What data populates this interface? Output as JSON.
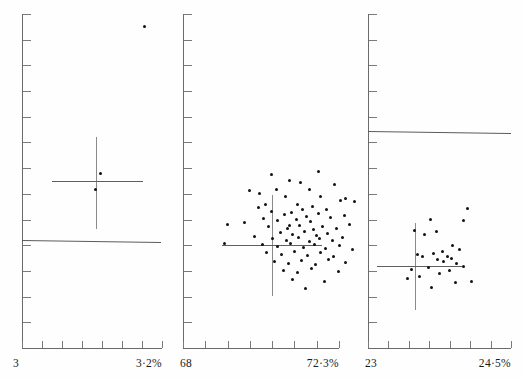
{
  "figure": {
    "type": "multi-panel-scatter",
    "panel_count": 3,
    "width": 523,
    "height": 378,
    "background": "#ffffff",
    "point_color": "#111111",
    "axis_color": "#6a6a6a"
  },
  "chart_data": [
    {
      "type": "scatter",
      "panel_index": 0,
      "title": "",
      "xlabel": "",
      "ylabel": "",
      "x_tick_count": 7,
      "y_tick_count": 13,
      "grid": false,
      "legend": null,
      "axis_min_label": "3",
      "axis_max_label": "3·2%",
      "xlim": [
        3.0,
        3.2
      ],
      "n_points": 3,
      "points": [
        {
          "x": 144,
          "y": 26
        },
        {
          "x": 100,
          "y": 173
        },
        {
          "x": 95,
          "y": 189
        }
      ],
      "cross": {
        "cx": 96,
        "cy": 181,
        "x_left": 52,
        "x_right": 143,
        "y_top": 137,
        "y_bottom": 229
      },
      "trend_line": {
        "x1": 22,
        "y1": 240,
        "x2": 161,
        "y2": 242
      }
    },
    {
      "type": "scatter",
      "panel_index": 1,
      "title": "",
      "xlabel": "",
      "ylabel": "",
      "x_tick_count": 7,
      "y_tick_count": 13,
      "grid": false,
      "legend": null,
      "axis_min_label": "68",
      "axis_max_label": "72·3%",
      "xlim": [
        68.0,
        72.3
      ],
      "n_points": 78,
      "points": [
        {
          "x": 318,
          "y": 171
        },
        {
          "x": 271,
          "y": 174
        },
        {
          "x": 289,
          "y": 180
        },
        {
          "x": 276,
          "y": 189
        },
        {
          "x": 300,
          "y": 182
        },
        {
          "x": 249,
          "y": 190
        },
        {
          "x": 259,
          "y": 193
        },
        {
          "x": 309,
          "y": 189
        },
        {
          "x": 334,
          "y": 184
        },
        {
          "x": 285,
          "y": 196
        },
        {
          "x": 320,
          "y": 196
        },
        {
          "x": 345,
          "y": 198
        },
        {
          "x": 340,
          "y": 200
        },
        {
          "x": 354,
          "y": 201
        },
        {
          "x": 265,
          "y": 204
        },
        {
          "x": 258,
          "y": 207
        },
        {
          "x": 297,
          "y": 204
        },
        {
          "x": 312,
          "y": 206
        },
        {
          "x": 271,
          "y": 211
        },
        {
          "x": 291,
          "y": 212
        },
        {
          "x": 302,
          "y": 209
        },
        {
          "x": 326,
          "y": 209
        },
        {
          "x": 284,
          "y": 214
        },
        {
          "x": 306,
          "y": 216
        },
        {
          "x": 318,
          "y": 213
        },
        {
          "x": 263,
          "y": 218
        },
        {
          "x": 277,
          "y": 220
        },
        {
          "x": 296,
          "y": 219
        },
        {
          "x": 310,
          "y": 221
        },
        {
          "x": 330,
          "y": 217
        },
        {
          "x": 344,
          "y": 215
        },
        {
          "x": 227,
          "y": 224
        },
        {
          "x": 244,
          "y": 222
        },
        {
          "x": 268,
          "y": 226
        },
        {
          "x": 287,
          "y": 228
        },
        {
          "x": 299,
          "y": 225
        },
        {
          "x": 313,
          "y": 229
        },
        {
          "x": 322,
          "y": 226
        },
        {
          "x": 336,
          "y": 228
        },
        {
          "x": 349,
          "y": 224
        },
        {
          "x": 280,
          "y": 232
        },
        {
          "x": 292,
          "y": 234
        },
        {
          "x": 304,
          "y": 231
        },
        {
          "x": 316,
          "y": 235
        },
        {
          "x": 327,
          "y": 233
        },
        {
          "x": 254,
          "y": 236
        },
        {
          "x": 272,
          "y": 238
        },
        {
          "x": 286,
          "y": 240
        },
        {
          "x": 298,
          "y": 237
        },
        {
          "x": 309,
          "y": 241
        },
        {
          "x": 319,
          "y": 238
        },
        {
          "x": 332,
          "y": 240
        },
        {
          "x": 342,
          "y": 237
        },
        {
          "x": 224,
          "y": 243
        },
        {
          "x": 262,
          "y": 244
        },
        {
          "x": 277,
          "y": 246
        },
        {
          "x": 290,
          "y": 243
        },
        {
          "x": 303,
          "y": 247
        },
        {
          "x": 314,
          "y": 244
        },
        {
          "x": 325,
          "y": 248
        },
        {
          "x": 339,
          "y": 245
        },
        {
          "x": 352,
          "y": 249
        },
        {
          "x": 266,
          "y": 252
        },
        {
          "x": 281,
          "y": 254
        },
        {
          "x": 294,
          "y": 251
        },
        {
          "x": 307,
          "y": 255
        },
        {
          "x": 320,
          "y": 252
        },
        {
          "x": 333,
          "y": 256
        },
        {
          "x": 274,
          "y": 261
        },
        {
          "x": 288,
          "y": 263
        },
        {
          "x": 301,
          "y": 260
        },
        {
          "x": 315,
          "y": 264
        },
        {
          "x": 328,
          "y": 259
        },
        {
          "x": 345,
          "y": 262
        },
        {
          "x": 283,
          "y": 270
        },
        {
          "x": 297,
          "y": 272
        },
        {
          "x": 311,
          "y": 268
        },
        {
          "x": 338,
          "y": 271
        },
        {
          "x": 292,
          "y": 279
        },
        {
          "x": 324,
          "y": 281
        },
        {
          "x": 305,
          "y": 288
        },
        {
          "x": 289,
          "y": 225
        }
      ],
      "cross": {
        "cx": 272,
        "cy": 245,
        "x_left": 222,
        "x_right": 322,
        "y_top": 195,
        "y_bottom": 296
      },
      "trend_line": null
    },
    {
      "type": "scatter",
      "panel_index": 2,
      "title": "",
      "xlabel": "",
      "ylabel": "",
      "x_tick_count": 7,
      "y_tick_count": 13,
      "grid": false,
      "legend": null,
      "axis_min_label": "23",
      "axis_max_label": "24·5%",
      "xlim": [
        23.0,
        24.5
      ],
      "n_points": 25,
      "points": [
        {
          "x": 467,
          "y": 208
        },
        {
          "x": 463,
          "y": 220
        },
        {
          "x": 430,
          "y": 219
        },
        {
          "x": 414,
          "y": 230
        },
        {
          "x": 436,
          "y": 231
        },
        {
          "x": 424,
          "y": 234
        },
        {
          "x": 452,
          "y": 245
        },
        {
          "x": 442,
          "y": 251
        },
        {
          "x": 433,
          "y": 253
        },
        {
          "x": 459,
          "y": 249
        },
        {
          "x": 417,
          "y": 254
        },
        {
          "x": 422,
          "y": 256
        },
        {
          "x": 447,
          "y": 256
        },
        {
          "x": 451,
          "y": 258
        },
        {
          "x": 437,
          "y": 259
        },
        {
          "x": 443,
          "y": 261
        },
        {
          "x": 456,
          "y": 263
        },
        {
          "x": 463,
          "y": 266
        },
        {
          "x": 428,
          "y": 267
        },
        {
          "x": 411,
          "y": 269
        },
        {
          "x": 449,
          "y": 270
        },
        {
          "x": 439,
          "y": 273
        },
        {
          "x": 419,
          "y": 276
        },
        {
          "x": 407,
          "y": 278
        },
        {
          "x": 471,
          "y": 281
        },
        {
          "x": 455,
          "y": 282
        },
        {
          "x": 431,
          "y": 287
        }
      ],
      "cross": {
        "cx": 415,
        "cy": 266,
        "x_left": 377,
        "x_right": 462,
        "y_top": 223,
        "y_bottom": 310
      },
      "trend_line": {
        "x1": 368,
        "y1": 131,
        "x2": 511,
        "y2": 133
      }
    }
  ],
  "panels": [
    {
      "name": "panel-left",
      "left": 10,
      "frame_left": 22,
      "frame_right": 162,
      "frame_top": 14,
      "frame_bottom": 348,
      "min_label": "3",
      "max_label": "3·2%",
      "min_label_x": 13,
      "max_label_x": 110
    },
    {
      "name": "panel-middle",
      "left": 10,
      "frame_left": 183,
      "frame_right": 339,
      "frame_top": 14,
      "frame_bottom": 348,
      "min_label": "68",
      "max_label": "72·3%",
      "min_label_x": 180,
      "max_label_x": 280
    },
    {
      "name": "panel-right",
      "left": 10,
      "frame_left": 368,
      "frame_right": 511,
      "frame_top": 14,
      "frame_bottom": 348,
      "min_label": "23",
      "max_label": "24·5%",
      "min_label_x": 365,
      "max_label_x": 450
    }
  ]
}
